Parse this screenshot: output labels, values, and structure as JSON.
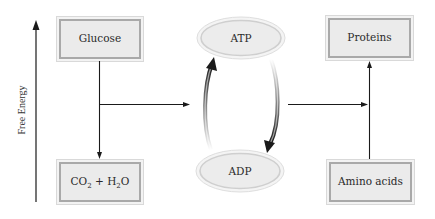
{
  "axis": {
    "label": "Free Energy"
  },
  "nodes": {
    "glucose": {
      "label": "Glucose"
    },
    "co2_h2o": {
      "label_part1": "CO",
      "sub1": "2",
      "label_part2": " + H",
      "sub2": "2",
      "label_part3": "O"
    },
    "atp": {
      "label": "ATP"
    },
    "adp": {
      "label": "ADP"
    },
    "proteins": {
      "label": "Proteins"
    },
    "amino_acids": {
      "label": "Amino acids"
    }
  },
  "colors": {
    "box_fill": "#ebebeb",
    "box_outer": "#d9d9d9",
    "box_inner": "#a9a9a9",
    "ellipse_fill": "#ececec",
    "ellipse_ring": "#d0d0d0",
    "line": "#1a1a1a"
  }
}
